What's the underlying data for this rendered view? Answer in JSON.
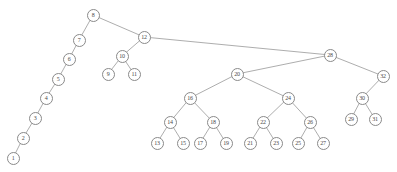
{
  "figure": {
    "type": "binary-search-tree",
    "background_color": "#ffffff",
    "node_fill_color": "#ffffff",
    "node_stroke_color": "#8a8a8a",
    "edge_color": "#8a8a8a",
    "label_color": "#4a4a4a",
    "node_count": 32,
    "root_label": "8"
  },
  "nodes": [
    {
      "id": "n8",
      "label": "8",
      "x": 93,
      "y": 15
    },
    {
      "id": "n7",
      "label": "7",
      "x": 79,
      "y": 40
    },
    {
      "id": "n6",
      "label": "6",
      "x": 69,
      "y": 59
    },
    {
      "id": "n5",
      "label": "5",
      "x": 58,
      "y": 79
    },
    {
      "id": "n4",
      "label": "4",
      "x": 46,
      "y": 98
    },
    {
      "id": "n3",
      "label": "3",
      "x": 35,
      "y": 118
    },
    {
      "id": "n2",
      "label": "2",
      "x": 23,
      "y": 138
    },
    {
      "id": "n1",
      "label": "1",
      "x": 13,
      "y": 158
    },
    {
      "id": "n12",
      "label": "12",
      "x": 144,
      "y": 37
    },
    {
      "id": "n10",
      "label": "10",
      "x": 122,
      "y": 56
    },
    {
      "id": "n9",
      "label": "9",
      "x": 108,
      "y": 74
    },
    {
      "id": "n11",
      "label": "11",
      "x": 134,
      "y": 74
    },
    {
      "id": "n28",
      "label": "28",
      "x": 330,
      "y": 55
    },
    {
      "id": "n20",
      "label": "20",
      "x": 237,
      "y": 74
    },
    {
      "id": "n16",
      "label": "16",
      "x": 190,
      "y": 98
    },
    {
      "id": "n14",
      "label": "14",
      "x": 170,
      "y": 122
    },
    {
      "id": "n13",
      "label": "13",
      "x": 157,
      "y": 143
    },
    {
      "id": "n15",
      "label": "15",
      "x": 183,
      "y": 143
    },
    {
      "id": "n18",
      "label": "18",
      "x": 213,
      "y": 122
    },
    {
      "id": "n17",
      "label": "17",
      "x": 200,
      "y": 143
    },
    {
      "id": "n19",
      "label": "19",
      "x": 226,
      "y": 143
    },
    {
      "id": "n24",
      "label": "24",
      "x": 288,
      "y": 98
    },
    {
      "id": "n22",
      "label": "22",
      "x": 263,
      "y": 122
    },
    {
      "id": "n21",
      "label": "21",
      "x": 250,
      "y": 143
    },
    {
      "id": "n23",
      "label": "23",
      "x": 276,
      "y": 143
    },
    {
      "id": "n26",
      "label": "26",
      "x": 310,
      "y": 122
    },
    {
      "id": "n25",
      "label": "25",
      "x": 298,
      "y": 143
    },
    {
      "id": "n27",
      "label": "27",
      "x": 323,
      "y": 143
    },
    {
      "id": "n32",
      "label": "32",
      "x": 383,
      "y": 76
    },
    {
      "id": "n30",
      "label": "30",
      "x": 362,
      "y": 98
    },
    {
      "id": "n29",
      "label": "29",
      "x": 351,
      "y": 119
    },
    {
      "id": "n31",
      "label": "31",
      "x": 375,
      "y": 119
    }
  ],
  "edges": [
    {
      "from": "n8",
      "to": "n7"
    },
    {
      "from": "n7",
      "to": "n6"
    },
    {
      "from": "n6",
      "to": "n5"
    },
    {
      "from": "n5",
      "to": "n4"
    },
    {
      "from": "n4",
      "to": "n3"
    },
    {
      "from": "n3",
      "to": "n2"
    },
    {
      "from": "n2",
      "to": "n1"
    },
    {
      "from": "n8",
      "to": "n12"
    },
    {
      "from": "n12",
      "to": "n10"
    },
    {
      "from": "n10",
      "to": "n9"
    },
    {
      "from": "n10",
      "to": "n11"
    },
    {
      "from": "n12",
      "to": "n28"
    },
    {
      "from": "n28",
      "to": "n20"
    },
    {
      "from": "n20",
      "to": "n16"
    },
    {
      "from": "n16",
      "to": "n14"
    },
    {
      "from": "n14",
      "to": "n13"
    },
    {
      "from": "n14",
      "to": "n15"
    },
    {
      "from": "n16",
      "to": "n18"
    },
    {
      "from": "n18",
      "to": "n17"
    },
    {
      "from": "n18",
      "to": "n19"
    },
    {
      "from": "n20",
      "to": "n24"
    },
    {
      "from": "n24",
      "to": "n22"
    },
    {
      "from": "n22",
      "to": "n21"
    },
    {
      "from": "n22",
      "to": "n23"
    },
    {
      "from": "n24",
      "to": "n26"
    },
    {
      "from": "n26",
      "to": "n25"
    },
    {
      "from": "n26",
      "to": "n27"
    },
    {
      "from": "n28",
      "to": "n32"
    },
    {
      "from": "n32",
      "to": "n30"
    },
    {
      "from": "n30",
      "to": "n29"
    },
    {
      "from": "n30",
      "to": "n31"
    }
  ]
}
